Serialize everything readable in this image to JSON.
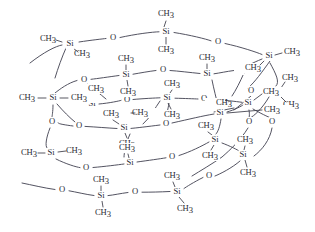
{
  "figure": {
    "background_color": "#ffffff",
    "bond_color": "#3a3a46",
    "label_color": "#2b2b33"
  },
  "labels": {
    "silicon": "Si",
    "oxygen": "O",
    "methyl_c": "CH",
    "methyl_sub": "3",
    "methyl": "CH3"
  },
  "chart_data": {
    "type": "diagram",
    "atoms": [
      {
        "id": "Si1",
        "el": "Si",
        "x": 70,
        "y": 44
      },
      {
        "id": "O1",
        "el": "O",
        "x": 113,
        "y": 38
      },
      {
        "id": "Si2",
        "el": "Si",
        "x": 166,
        "y": 32
      },
      {
        "id": "O2",
        "el": "O",
        "x": 218,
        "y": 42
      },
      {
        "id": "Si3",
        "el": "Si",
        "x": 269,
        "y": 56
      },
      {
        "id": "O3",
        "el": "O",
        "x": 251,
        "y": 91
      },
      {
        "id": "Si4",
        "el": "Si",
        "x": 275,
        "y": 92
      },
      {
        "id": "O4",
        "el": "O",
        "x": 241,
        "y": 70
      },
      {
        "id": "Si5",
        "el": "Si",
        "x": 207,
        "y": 74
      },
      {
        "id": "O5",
        "el": "O",
        "x": 163,
        "y": 70
      },
      {
        "id": "Si6",
        "el": "Si",
        "x": 126,
        "y": 75
      },
      {
        "id": "O6",
        "el": "O",
        "x": 84,
        "y": 80
      },
      {
        "id": "Si7",
        "el": "Si",
        "x": 53,
        "y": 98
      },
      {
        "id": "Si8",
        "el": "Si",
        "x": 92,
        "y": 104
      },
      {
        "id": "O7",
        "el": "O",
        "x": 127,
        "y": 100
      },
      {
        "id": "Si9",
        "el": "Si",
        "x": 167,
        "y": 98
      },
      {
        "id": "O8",
        "el": "O",
        "x": 204,
        "y": 99
      },
      {
        "id": "Si10",
        "el": "Si",
        "x": 248,
        "y": 103
      },
      {
        "id": "Si11",
        "el": "Si",
        "x": 220,
        "y": 113
      },
      {
        "id": "O9",
        "el": "O",
        "x": 52,
        "y": 122
      },
      {
        "id": "O10",
        "el": "O",
        "x": 79,
        "y": 126
      },
      {
        "id": "Si12",
        "el": "Si",
        "x": 124,
        "y": 128
      },
      {
        "id": "O11",
        "el": "O",
        "x": 166,
        "y": 124
      },
      {
        "id": "O12",
        "el": "O",
        "x": 249,
        "y": 122
      },
      {
        "id": "O13",
        "el": "O",
        "x": 272,
        "y": 122
      },
      {
        "id": "Si13",
        "el": "Si",
        "x": 51,
        "y": 153
      },
      {
        "id": "O14",
        "el": "O",
        "x": 86,
        "y": 168
      },
      {
        "id": "Si14",
        "el": "Si",
        "x": 130,
        "y": 163
      },
      {
        "id": "O15",
        "el": "O",
        "x": 172,
        "y": 157
      },
      {
        "id": "Si15",
        "el": "Si",
        "x": 215,
        "y": 140
      },
      {
        "id": "Si16",
        "el": "Si",
        "x": 243,
        "y": 155
      },
      {
        "id": "O16",
        "el": "O",
        "x": 209,
        "y": 176
      },
      {
        "id": "Si17",
        "el": "Si",
        "x": 177,
        "y": 192
      },
      {
        "id": "O17",
        "el": "O",
        "x": 135,
        "y": 192
      },
      {
        "id": "Si18",
        "el": "Si",
        "x": 101,
        "y": 196
      },
      {
        "id": "O18",
        "el": "O",
        "x": 62,
        "y": 190
      }
    ],
    "methyl_groups": [
      {
        "x": 48,
        "y": 39,
        "anchor": "Si1",
        "align": "end"
      },
      {
        "x": 82,
        "y": 54,
        "anchor": "Si1",
        "align": "start"
      },
      {
        "x": 166,
        "y": 14,
        "anchor": "Si2",
        "align": "middle"
      },
      {
        "x": 166,
        "y": 50,
        "anchor": "Si2",
        "align": "middle"
      },
      {
        "x": 292,
        "y": 52,
        "anchor": "Si3",
        "align": "start"
      },
      {
        "x": 253,
        "y": 68,
        "anchor": "Si3",
        "align": "end"
      },
      {
        "x": 290,
        "y": 78,
        "anchor": "Si4",
        "align": "start"
      },
      {
        "x": 291,
        "y": 105,
        "anchor": "Si4",
        "align": "start"
      },
      {
        "x": 207,
        "y": 58,
        "anchor": "Si5",
        "align": "middle"
      },
      {
        "x": 126,
        "y": 59,
        "anchor": "Si6",
        "align": "middle"
      },
      {
        "x": 128,
        "y": 92,
        "anchor": "Si6",
        "align": "middle"
      },
      {
        "x": 27,
        "y": 98,
        "anchor": "Si7",
        "align": "end"
      },
      {
        "x": 79,
        "y": 98,
        "anchor": "Si7",
        "align": "start"
      },
      {
        "x": 96,
        "y": 89,
        "anchor": "Si8",
        "align": "middle"
      },
      {
        "x": 172,
        "y": 84,
        "anchor": "Si9",
        "align": "middle"
      },
      {
        "x": 172,
        "y": 115,
        "anchor": "Si9",
        "align": "middle"
      },
      {
        "x": 224,
        "y": 103,
        "anchor": "Si11",
        "align": "end"
      },
      {
        "x": 272,
        "y": 110,
        "anchor": "Si11",
        "align": "start"
      },
      {
        "x": 271,
        "y": 92,
        "anchor": "Si10",
        "align": "start"
      },
      {
        "x": 111,
        "y": 114,
        "anchor": "Si12",
        "align": "middle"
      },
      {
        "x": 127,
        "y": 144,
        "anchor": "Si12",
        "align": "middle"
      },
      {
        "x": 29,
        "y": 153,
        "anchor": "Si13",
        "align": "end"
      },
      {
        "x": 74,
        "y": 151,
        "anchor": "Si13",
        "align": "start"
      },
      {
        "x": 127,
        "y": 148,
        "anchor": "Si14",
        "align": "middle"
      },
      {
        "x": 206,
        "y": 126,
        "anchor": "Si15",
        "align": "middle"
      },
      {
        "x": 210,
        "y": 156,
        "anchor": "Si15",
        "align": "middle"
      },
      {
        "x": 245,
        "y": 140,
        "anchor": "Si16",
        "align": "middle"
      },
      {
        "x": 248,
        "y": 173,
        "anchor": "Si16",
        "align": "middle"
      },
      {
        "x": 172,
        "y": 176,
        "anchor": "Si17",
        "align": "middle"
      },
      {
        "x": 185,
        "y": 209,
        "anchor": "Si17",
        "align": "middle"
      },
      {
        "x": 101,
        "y": 180,
        "anchor": "Si18",
        "align": "middle"
      },
      {
        "x": 103,
        "y": 213,
        "anchor": "Si18",
        "align": "middle"
      },
      {
        "x": 140,
        "y": 113,
        "anchor": "Si12",
        "align": "start"
      }
    ]
  }
}
